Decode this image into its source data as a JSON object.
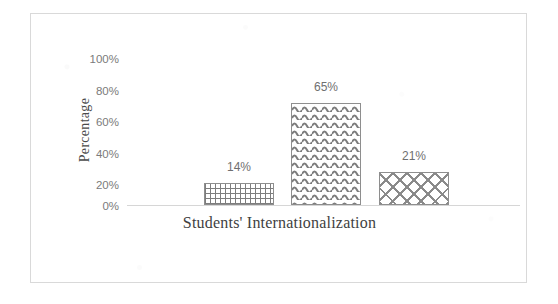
{
  "chart_data": {
    "type": "bar",
    "title": "",
    "xlabel": "Students' Internationalization",
    "ylabel": "Percentage",
    "categories": [
      "Bar 1",
      "Bar 2",
      "Bar 3"
    ],
    "values": [
      14,
      65,
      21
    ],
    "data_labels": [
      "14%",
      "65%",
      "21%"
    ],
    "ylim": [
      0,
      100
    ],
    "ytick_values": [
      100,
      80,
      60,
      40,
      20,
      0
    ],
    "ytick_labels": [
      "100%",
      "80%",
      "60%",
      "40%",
      "20%",
      "0%"
    ],
    "grid": false,
    "legend": "none",
    "series": [
      {
        "name": "Students' Internationalization",
        "values": [
          14,
          65,
          21
        ],
        "fill_patterns": [
          "fine-grid",
          "wavy-zigzag",
          "diagonal-cross-hatch"
        ]
      }
    ]
  },
  "colors": {
    "frame_border": "#d9d9d9",
    "axis_line": "#d6d6d6",
    "tick_text": "#7b7b7b",
    "label_text": "#6f6f6f",
    "title_text": "#3f3f3f",
    "bar_outline": "#8e8e8e",
    "hatch": "#7d7d7d",
    "background": "#ffffff"
  }
}
